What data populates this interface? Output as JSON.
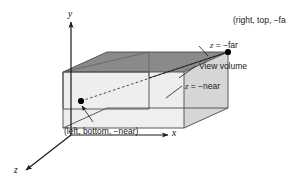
{
  "figure": {
    "type": "view-volume-diagram",
    "background": "#ffffff",
    "axes": {
      "x_label": "x",
      "y_label": "y",
      "z_label": "z"
    },
    "annotations": {
      "far_corner_point": "(right, top, −far)",
      "near_corner_point": "(left, bottom, −near)",
      "far_plane": {
        "var": "z",
        "rel": " = ",
        "value": "−far"
      },
      "near_plane": {
        "var": "z",
        "rel": " = ",
        "value": "−near"
      },
      "volume_label": "View volume"
    },
    "colors": {
      "top_face": "#8a8a8a",
      "side_face": "#dcdcdc",
      "front_face": "#ececec",
      "outline": "#555555",
      "axis": "#1a1a1a",
      "text": "#1a1a1a",
      "point": "#000000"
    }
  }
}
